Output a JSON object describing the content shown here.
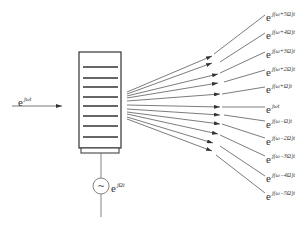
{
  "diagram": {
    "type": "frequency-comb-modulator",
    "input_label": {
      "base": "e",
      "exp": "jωt"
    },
    "modulator_label": {
      "base": "e",
      "exp": "jΩt"
    },
    "source_symbol": "~",
    "modulator_block": {
      "stripes": 8
    },
    "outputs": [
      {
        "base": "e",
        "exp": "j(ω+5Ω)t"
      },
      {
        "base": "e",
        "exp": "j(ω+4Ω)t"
      },
      {
        "base": "e",
        "exp": "j(ω+3Ω)t"
      },
      {
        "base": "e",
        "exp": "j(ω+2Ω)t"
      },
      {
        "base": "e",
        "exp": "j(ω+Ω)t"
      },
      {
        "base": "e",
        "exp": "jωt"
      },
      {
        "base": "e",
        "exp": "j(ω−Ω)t"
      },
      {
        "base": "e",
        "exp": "j(ω−2Ω)t"
      },
      {
        "base": "e",
        "exp": "j(ω−3Ω)t"
      },
      {
        "base": "e",
        "exp": "j(ω−4Ω)t"
      },
      {
        "base": "e",
        "exp": "j(ω−5Ω)t"
      }
    ],
    "colors": {
      "line": "#444444",
      "block": "#333333",
      "text": "#333333"
    }
  }
}
